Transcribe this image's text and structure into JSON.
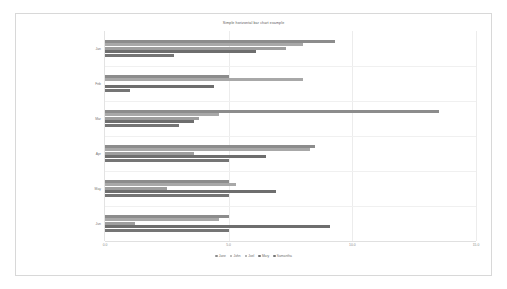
{
  "chart_data": {
    "type": "bar",
    "orientation": "horizontal",
    "title": "Simple horizontal bar chart example",
    "xlabel": "",
    "ylabel": "",
    "xlim": [
      0.0,
      15.0
    ],
    "xticks": [
      "0.0",
      "5.0",
      "10.0",
      "15.0"
    ],
    "xtick_values": [
      0.0,
      5.0,
      10.0,
      15.0
    ],
    "grid": true,
    "legend_position": "bottom",
    "categories": [
      "Jan",
      "Feb",
      "Mar",
      "Apr",
      "May",
      "Jun"
    ],
    "series": [
      {
        "name": "Jane",
        "color": "#8c8c8c",
        "values": [
          9.3,
          5.0,
          13.5,
          8.5,
          5.0,
          5.0
        ]
      },
      {
        "name": "John",
        "color": "#a8a8a8",
        "values": [
          8.0,
          8.0,
          4.6,
          8.3,
          5.3,
          4.6
        ]
      },
      {
        "name": "Joel",
        "color": "#9e9e9e",
        "values": [
          7.3,
          0.0,
          3.8,
          3.6,
          2.5,
          1.2
        ]
      },
      {
        "name": "Mary",
        "color": "#6e6e6e",
        "values": [
          6.1,
          4.4,
          3.6,
          6.5,
          6.9,
          9.1
        ]
      },
      {
        "name": "Samantha",
        "color": "#757575",
        "values": [
          2.8,
          1.0,
          3.0,
          5.0,
          5.0,
          5.0
        ]
      }
    ]
  },
  "legend": {
    "items": [
      {
        "label": "Jane"
      },
      {
        "label": "John"
      },
      {
        "label": "Joel"
      },
      {
        "label": "Mary"
      },
      {
        "label": "Samantha"
      }
    ]
  }
}
